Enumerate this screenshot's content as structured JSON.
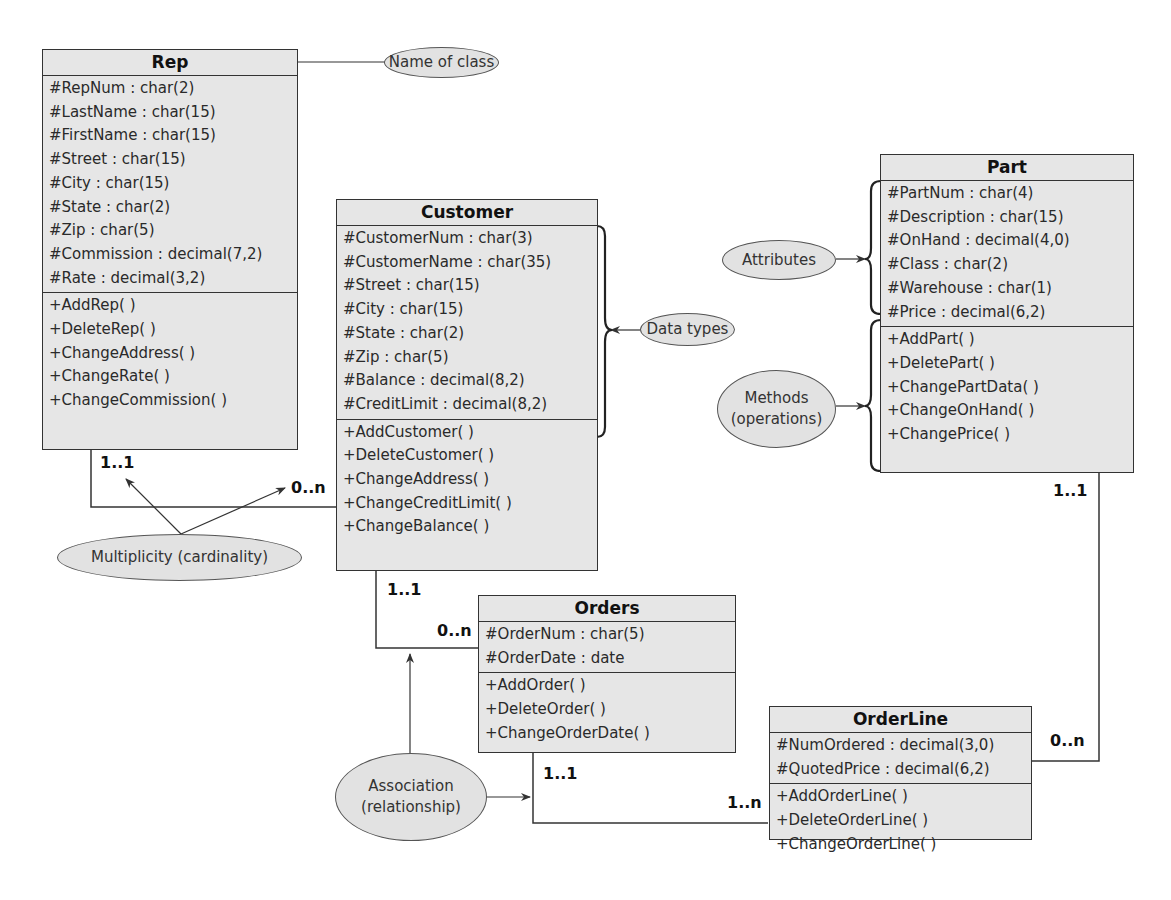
{
  "classes": {
    "rep": {
      "name": "Rep",
      "attributes": [
        "#RepNum : char(2)",
        "#LastName : char(15)",
        "#FirstName : char(15)",
        "#Street : char(15)",
        "#City : char(15)",
        "#State : char(2)",
        "#Zip : char(5)",
        "#Commission : decimal(7,2)",
        "#Rate : decimal(3,2)"
      ],
      "methods": [
        "+AddRep( )",
        "+DeleteRep( )",
        "+ChangeAddress( )",
        "+ChangeRate( )",
        "+ChangeCommission( )"
      ]
    },
    "customer": {
      "name": "Customer",
      "attributes": [
        "#CustomerNum : char(3)",
        "#CustomerName : char(35)",
        "#Street : char(15)",
        "#City : char(15)",
        "#State : char(2)",
        "#Zip : char(5)",
        "#Balance : decimal(8,2)",
        "#CreditLimit : decimal(8,2)"
      ],
      "methods": [
        "+AddCustomer( )",
        "+DeleteCustomer( )",
        "+ChangeAddress( )",
        "+ChangeCreditLimit( )",
        "+ChangeBalance( )"
      ]
    },
    "part": {
      "name": "Part",
      "attributes": [
        "#PartNum : char(4)",
        "#Description : char(15)",
        "#OnHand : decimal(4,0)",
        "#Class : char(2)",
        "#Warehouse : char(1)",
        "#Price : decimal(6,2)"
      ],
      "methods": [
        "+AddPart( )",
        "+DeletePart( )",
        "+ChangePartData( )",
        "+ChangeOnHand( )",
        "+ChangePrice( )"
      ]
    },
    "orders": {
      "name": "Orders",
      "attributes": [
        "#OrderNum : char(5)",
        "#OrderDate : date"
      ],
      "methods": [
        "+AddOrder( )",
        "+DeleteOrder( )",
        "+ChangeOrderDate( )"
      ]
    },
    "orderline": {
      "name": "OrderLine",
      "attributes": [
        "#NumOrdered : decimal(3,0)",
        "#QuotedPrice : decimal(6,2)"
      ],
      "methods": [
        "+AddOrderLine( )",
        "+DeleteOrderLine( )",
        "+ChangeOrderLine( )"
      ]
    }
  },
  "multiplicities": {
    "rep_customer_rep": "1..1",
    "rep_customer_customer": "0..n",
    "customer_orders_customer": "1..1",
    "customer_orders_orders": "0..n",
    "orders_orderline_orders": "1..1",
    "orders_orderline_orderline": "1..n",
    "part_orderline_part": "1..1",
    "part_orderline_orderline": "0..n"
  },
  "annotations": {
    "name_of_class": "Name of class",
    "data_types": "Data types",
    "attributes": "Attributes",
    "methods_line1": "Methods",
    "methods_line2": "(operations)",
    "multiplicity": "Multiplicity (cardinality)",
    "association_line1": "Association",
    "association_line2": "(relationship)"
  }
}
